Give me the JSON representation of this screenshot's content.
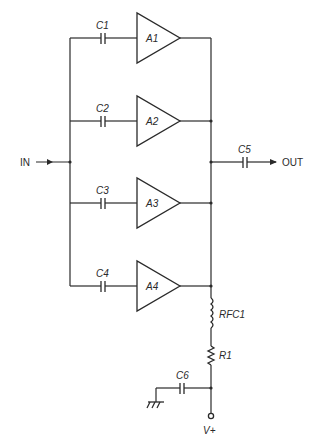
{
  "diagram": {
    "type": "circuit-schematic"
  },
  "terminals": {
    "input": "IN",
    "output": "OUT",
    "supply": "V+"
  },
  "amplifiers": [
    {
      "id": "A1",
      "label": "A1",
      "input_cap": "C1"
    },
    {
      "id": "A2",
      "label": "A2",
      "input_cap": "C2"
    },
    {
      "id": "A3",
      "label": "A3",
      "input_cap": "C3"
    },
    {
      "id": "A4",
      "label": "A4",
      "input_cap": "C4"
    }
  ],
  "components": {
    "c1": "C1",
    "c2": "C2",
    "c3": "C3",
    "c4": "C4",
    "c5": "C5",
    "c6": "C6",
    "rfc1": "RFC1",
    "r1": "R1",
    "a1": "A1",
    "a2": "A2",
    "a3": "A3",
    "a4": "A4"
  },
  "colors": {
    "line": "#2a2a2a",
    "background": "#ffffff"
  }
}
